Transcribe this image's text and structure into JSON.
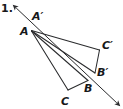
{
  "figure": {
    "item_number": "1.",
    "background_color": "#ffffff",
    "stroke_color": "#2a2b2d",
    "label_color": "#17181a",
    "width": 123,
    "height": 109,
    "labels": [
      {
        "id": "A-prime",
        "text": "A′",
        "x": 32,
        "y": 11
      },
      {
        "id": "A",
        "text": "A",
        "x": 20,
        "y": 26
      },
      {
        "id": "C-prime",
        "text": "C′",
        "x": 102,
        "y": 40
      },
      {
        "id": "B-prime",
        "text": "B′",
        "x": 97,
        "y": 67
      },
      {
        "id": "B",
        "text": "B",
        "x": 84,
        "y": 83
      },
      {
        "id": "C",
        "text": "C",
        "x": 61,
        "y": 96
      }
    ],
    "points": {
      "A": {
        "x": 31.5,
        "y": 31.0
      },
      "B": {
        "x": 88.0,
        "y": 80.5
      },
      "C": {
        "x": 68.0,
        "y": 90.0
      },
      "A_prime": {
        "x": 31.0,
        "y": 22.0
      },
      "B_prime": {
        "x": 95.0,
        "y": 73.0
      },
      "C_prime": {
        "x": 99.5,
        "y": 50.0
      }
    },
    "segments": [
      {
        "id": "seg-A-B",
        "from": "A",
        "to": "B"
      },
      {
        "id": "seg-A-C",
        "from": "A",
        "to": "C"
      },
      {
        "id": "seg-B-C",
        "from": "B",
        "to": "C"
      },
      {
        "id": "seg-A-Cp",
        "from": "A",
        "to": "C_prime"
      },
      {
        "id": "seg-A-Bp",
        "from": "A",
        "to": "B_prime"
      },
      {
        "id": "seg-Bp-Cp",
        "from": "B_prime",
        "to": "C_prime"
      }
    ],
    "ray": {
      "id": "ray-through-A-A-prime",
      "arrow_start": {
        "x": 14.0,
        "y": 6.0
      },
      "arrow_end": {
        "x": 119.0,
        "y": 105.0
      },
      "double_headed": true
    }
  }
}
